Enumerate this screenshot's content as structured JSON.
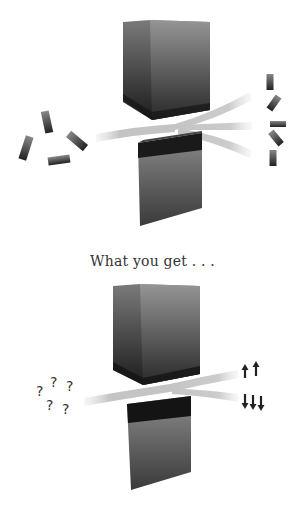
{
  "caption": "What you get . . .",
  "top_diagram": {
    "description": "Randomly oriented magnets passing between two magnet poles, deflected into a continuous spread",
    "incoming_magnets": 4,
    "outgoing_magnets": 5,
    "beams_out": 3
  },
  "bottom_diagram": {
    "incoming_symbols": [
      "?",
      "?",
      "?",
      "?",
      "?"
    ],
    "outgoing_up": [
      "↑",
      "↑"
    ],
    "outgoing_down": [
      "↓",
      "↓",
      "↓"
    ],
    "beams_out": 2
  },
  "colors": {
    "magnet_dark": "#1e1e1e",
    "magnet_light": "#8a8a8a",
    "beam": "#c8c8c8",
    "text": "#333333"
  }
}
